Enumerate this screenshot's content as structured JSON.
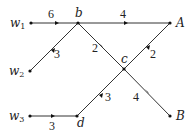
{
  "diagram": {
    "type": "weighted directed graph",
    "nodes": [
      {
        "id": "w1",
        "label": "w",
        "sub": "1",
        "x": 31,
        "y": 23
      },
      {
        "id": "w2",
        "label": "w",
        "sub": "2",
        "x": 30,
        "y": 71
      },
      {
        "id": "w3",
        "label": "w",
        "sub": "3",
        "x": 30,
        "y": 116
      },
      {
        "id": "b",
        "label": "b",
        "x": 78,
        "y": 23
      },
      {
        "id": "c",
        "label": "c",
        "x": 124,
        "y": 69
      },
      {
        "id": "d",
        "label": "d",
        "x": 77,
        "y": 116
      },
      {
        "id": "A",
        "label": "A",
        "x": 170,
        "y": 23
      },
      {
        "id": "B",
        "label": "B",
        "x": 170,
        "y": 116
      }
    ],
    "edges": [
      {
        "from": "w1",
        "to": "b",
        "weight": "6"
      },
      {
        "from": "b",
        "to": "A",
        "weight": "4"
      },
      {
        "from": "w2",
        "to": "b",
        "weight": "3"
      },
      {
        "from": "b",
        "to": "c",
        "weight": "2"
      },
      {
        "from": "c",
        "to": "A",
        "weight": "2"
      },
      {
        "from": "w3",
        "to": "d",
        "weight": "3"
      },
      {
        "from": "d",
        "to": "c",
        "weight": "3"
      },
      {
        "from": "c",
        "to": "B",
        "weight": "4"
      }
    ]
  }
}
